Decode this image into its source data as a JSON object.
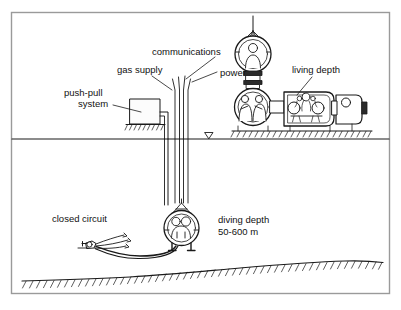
{
  "figure": {
    "border_color": "#9a9a9a",
    "ink_color": "#1a1a1a",
    "background": "#ffffff"
  },
  "labels": {
    "push_pull_line1": "push-pull",
    "push_pull_line2": "system",
    "gas_supply": "gas supply",
    "communications": "communications",
    "power": "power",
    "living_depth": "living depth",
    "closed_circuit": "closed circuit",
    "diving_depth_line1": "diving depth",
    "diving_depth_line2": "50-600 m"
  },
  "components": {
    "push_pull_unit": "push-pull-system-unit",
    "umbilical_bundle": "umbilical-lines",
    "waterline": "water-surface-line",
    "water_level_marker": "water-level-triangle",
    "deck_support": "deck-hatching",
    "transfer_bell_top": "surface-transfer-bell",
    "deck_decompression_chamber": "living-chamber",
    "chamber_transfer_lock": "transfer-lock-sphere",
    "diving_bell": "submerged-diving-bell",
    "closed_circuit_diver": "closed-circuit-diver",
    "seabed": "seabed-hatching"
  },
  "geometry": {
    "waterline_y": 139,
    "seabed_label": "sloping seabed with hatch ticks",
    "umbilical_count": 4,
    "diving_depth_range_min_m": 50,
    "diving_depth_range_max_m": 600
  }
}
